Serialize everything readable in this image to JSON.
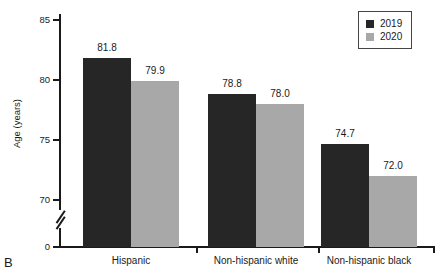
{
  "figure": {
    "panel_label": "B"
  },
  "chart_data": {
    "type": "bar",
    "title": "",
    "xlabel": "",
    "ylabel": "Age (years)",
    "categories": [
      "Hispanic",
      "Non-hispanic white",
      "Non-hispanic black"
    ],
    "series": [
      {
        "name": "2019",
        "color": "#262626",
        "values": [
          81.8,
          78.8,
          74.7
        ]
      },
      {
        "name": "2020",
        "color": "#a8a8a8",
        "values": [
          79.9,
          78.0,
          72.0
        ]
      }
    ],
    "value_labels": [
      [
        "81.8",
        "79.9"
      ],
      [
        "78.8",
        "78.0"
      ],
      [
        "74.7",
        "72.0"
      ]
    ],
    "ylim": [
      68.5,
      85.5
    ],
    "yticks": [
      85,
      80,
      75,
      70,
      0
    ],
    "ytick_labels": [
      "85",
      "80",
      "75",
      "70",
      "0"
    ],
    "axis_break": true,
    "grid": false,
    "legend_position": "top-right"
  },
  "legend": {
    "entries": [
      {
        "label": "2019",
        "color": "#262626"
      },
      {
        "label": "2020",
        "color": "#a8a8a8"
      }
    ]
  }
}
